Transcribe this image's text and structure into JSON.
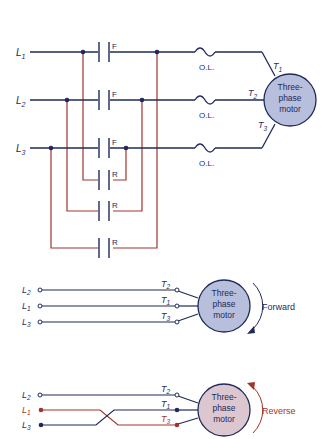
{
  "top_diagram": {
    "lines": [
      {
        "label": "L",
        "sub": "1"
      },
      {
        "label": "L",
        "sub": "2"
      },
      {
        "label": "L",
        "sub": "3"
      }
    ],
    "forward_contact_label": "F",
    "reverse_contact_label": "R",
    "overload_label": "O.L.",
    "motor": {
      "line1": "Three-",
      "line2": "phase",
      "line3": "motor"
    },
    "terminals": [
      {
        "label": "T",
        "sub": "1"
      },
      {
        "label": "T",
        "sub": "2"
      },
      {
        "label": "T",
        "sub": "3"
      }
    ]
  },
  "forward_diagram": {
    "lines": [
      {
        "label": "L",
        "sub": "2"
      },
      {
        "label": "L",
        "sub": "1"
      },
      {
        "label": "L",
        "sub": "3"
      }
    ],
    "terminals": [
      {
        "label": "T",
        "sub": "2"
      },
      {
        "label": "T",
        "sub": "1"
      },
      {
        "label": "T",
        "sub": "3"
      }
    ],
    "motor": {
      "line1": "Three-",
      "line2": "phase",
      "line3": "motor"
    },
    "direction_label": "Forward"
  },
  "reverse_diagram": {
    "lines": [
      {
        "label": "L",
        "sub": "2"
      },
      {
        "label": "L",
        "sub": "1"
      },
      {
        "label": "L",
        "sub": "3"
      }
    ],
    "terminals": [
      {
        "label": "T",
        "sub": "2"
      },
      {
        "label": "T",
        "sub": "1"
      },
      {
        "label": "T",
        "sub": "3"
      }
    ],
    "motor": {
      "line1": "Three-",
      "line2": "phase",
      "line3": "motor"
    },
    "direction_label": "Reverse"
  },
  "colors": {
    "navy": "#1f2a5a",
    "red": "#a0342c",
    "motor_blue": "#b8bfdc",
    "motor_pink": "#dcc6cf"
  }
}
